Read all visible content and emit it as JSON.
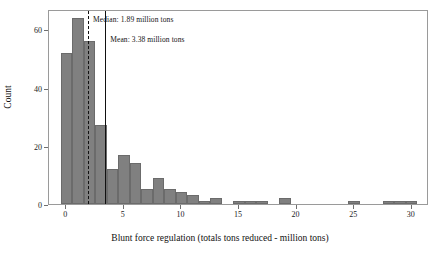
{
  "chart_data": {
    "type": "bar",
    "title": "",
    "subtitle": "",
    "xlabel": "Blunt force regulation (totals tons reduced - million tons)",
    "ylabel": "Count",
    "xlim": [
      -1.5,
      31.5
    ],
    "ylim": [
      0,
      67
    ],
    "xticks": [
      0,
      5,
      10,
      15,
      20,
      25,
      30
    ],
    "xtick_labels": [
      "0",
      "5",
      "10",
      "15",
      "20",
      "25",
      "30"
    ],
    "yticks": [
      0,
      20,
      40,
      60
    ],
    "ytick_labels": [
      "0",
      "20",
      "40",
      "60"
    ],
    "grid": false,
    "legend": "none",
    "bin_width": 1,
    "bar_color": "#808080",
    "bar_edge_color": "#6b6b6b",
    "bin_starts": [
      -0.5,
      0.5,
      1.5,
      2.5,
      3.5,
      4.5,
      5.5,
      6.5,
      7.5,
      8.5,
      9.5,
      10.5,
      11.5,
      12.5,
      13.5,
      14.5,
      15.5,
      16.5,
      17.5,
      18.5,
      19.5,
      20.5,
      21.5,
      22.5,
      23.5,
      24.5,
      25.5,
      26.5,
      27.5,
      28.5,
      29.5
    ],
    "bin_centers": [
      0,
      1,
      2,
      3,
      4,
      5,
      6,
      7,
      8,
      9,
      10,
      11,
      12,
      13,
      14,
      15,
      16,
      17,
      18,
      19,
      20,
      21,
      22,
      23,
      24,
      25,
      26,
      27,
      28,
      29,
      30
    ],
    "values": [
      52,
      64,
      56,
      27,
      12,
      17,
      14,
      5,
      9,
      5,
      4,
      3,
      1,
      2,
      0,
      1,
      1,
      1,
      0,
      2,
      0,
      0,
      0,
      0,
      0,
      1,
      0,
      0,
      1,
      1,
      1
    ],
    "annotations": [
      {
        "name": "median",
        "label": "Median: 1.89 million tons",
        "value": 1.89,
        "line_style": "dashed",
        "color": "#111111"
      },
      {
        "name": "mean",
        "label": "Mean: 3.38 million tons",
        "value": 3.38,
        "line_style": "solid",
        "color": "#111111"
      }
    ]
  }
}
